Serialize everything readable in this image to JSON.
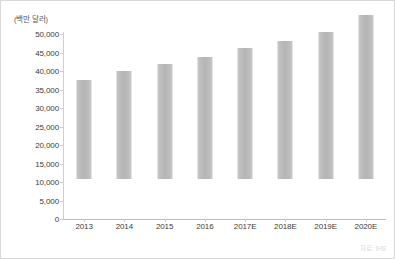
{
  "chart_data": {
    "type": "bar",
    "title": "",
    "subtitle": "",
    "unit_label": "(백만 달러)",
    "xlabel": "",
    "ylabel": "",
    "categories": [
      "2013",
      "2014",
      "2015",
      "2016",
      "2017E",
      "2018E",
      "2019E",
      "2020E"
    ],
    "values": [
      26700,
      29200,
      31100,
      33000,
      35500,
      37400,
      39800,
      44200
    ],
    "series": [
      {
        "name": "",
        "values": [
          26700,
          29200,
          31100,
          33000,
          35500,
          37400,
          39800,
          44200
        ]
      }
    ],
    "ylim": [
      0,
      50000
    ],
    "y_ticks": [
      0,
      5000,
      10000,
      15000,
      20000,
      25000,
      30000,
      35000,
      40000,
      45000,
      50000
    ],
    "y_tick_labels": [
      "0",
      "5,000",
      "10,000",
      "15,000",
      "20,000",
      "25,000",
      "30,000",
      "35,000",
      "40,000",
      "45,000",
      "50,000"
    ],
    "grid": false,
    "legend": false,
    "legend_position": "none",
    "bar_color": "#bdbdbd",
    "axis_color": "#cfcfcf",
    "text_color": "#3b3b3b",
    "annotations": []
  },
  "source": {
    "note": "자료: IHS"
  },
  "frame": {
    "border_color": "#d9d9d9",
    "background": "#ffffff"
  }
}
